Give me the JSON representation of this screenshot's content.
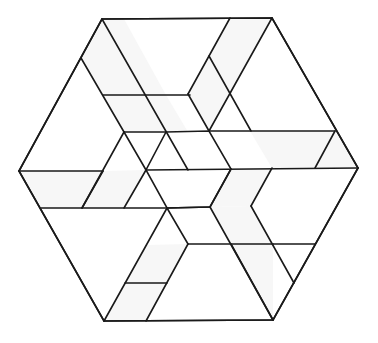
{
  "diagram": {
    "type": "geometric-tiling",
    "stroke_color": "#1a1a1a",
    "shade_color": "#f7f7f7",
    "background": "#ffffff",
    "outer_hexagon": [
      [
        102,
        19
      ],
      [
        272,
        18
      ],
      [
        358,
        168
      ],
      [
        273,
        320
      ],
      [
        104,
        321
      ],
      [
        19,
        171
      ]
    ],
    "center_hexagon": [
      [
        166,
        132
      ],
      [
        209,
        131
      ],
      [
        231,
        169
      ],
      [
        210,
        207
      ],
      [
        167,
        208
      ],
      [
        146,
        170
      ]
    ],
    "shaded_regions": [
      [
        [
          102,
          19
        ],
        [
          124,
          19
        ],
        [
          166,
          95
        ],
        [
          103,
          95
        ],
        [
          81,
          58
        ]
      ],
      [
        [
          103,
          95
        ],
        [
          166,
          95
        ],
        [
          188,
          132
        ],
        [
          124,
          132
        ]
      ],
      [
        [
          230,
          18
        ],
        [
          272,
          18
        ],
        [
          230,
          94
        ],
        [
          209,
          56
        ]
      ],
      [
        [
          209,
          56
        ],
        [
          230,
          94
        ],
        [
          209,
          131
        ],
        [
          188,
          94
        ]
      ],
      [
        [
          250,
          131
        ],
        [
          335,
          131
        ],
        [
          358,
          168
        ],
        [
          272,
          168
        ]
      ],
      [
        [
          231,
          169
        ],
        [
          272,
          168
        ],
        [
          251,
          206
        ],
        [
          210,
          207
        ]
      ],
      [
        [
          210,
          207
        ],
        [
          251,
          206
        ],
        [
          273,
          244
        ],
        [
          231,
          244
        ]
      ],
      [
        [
          231,
          244
        ],
        [
          273,
          244
        ],
        [
          273,
          320
        ],
        [
          252,
          283
        ]
      ],
      [
        [
          104,
          321
        ],
        [
          146,
          321
        ],
        [
          167,
          283
        ],
        [
          125,
          283
        ]
      ],
      [
        [
          125,
          283
        ],
        [
          167,
          283
        ],
        [
          188,
          244
        ],
        [
          146,
          245
        ]
      ],
      [
        [
          19,
          171
        ],
        [
          103,
          171
        ],
        [
          82,
          208
        ],
        [
          41,
          208
        ]
      ],
      [
        [
          103,
          171
        ],
        [
          146,
          170
        ],
        [
          124,
          208
        ],
        [
          82,
          208
        ]
      ]
    ],
    "lines": [
      [
        [
          102,
          19
        ],
        [
          272,
          18
        ]
      ],
      [
        [
          272,
          18
        ],
        [
          358,
          168
        ]
      ],
      [
        [
          358,
          168
        ],
        [
          273,
          320
        ]
      ],
      [
        [
          273,
          320
        ],
        [
          104,
          321
        ]
      ],
      [
        [
          104,
          321
        ],
        [
          19,
          171
        ]
      ],
      [
        [
          19,
          171
        ],
        [
          102,
          19
        ]
      ],
      [
        [
          102,
          19
        ],
        [
          188,
          170
        ]
      ],
      [
        [
          81,
          58
        ],
        [
          124,
          132
        ]
      ],
      [
        [
          103,
          95
        ],
        [
          190,
          95
        ]
      ],
      [
        [
          124,
          132
        ],
        [
          166,
          132
        ]
      ],
      [
        [
          230,
          18
        ],
        [
          188,
          94
        ]
      ],
      [
        [
          272,
          18
        ],
        [
          209,
          131
        ]
      ],
      [
        [
          209,
          56
        ],
        [
          251,
          131
        ]
      ],
      [
        [
          188,
          94
        ],
        [
          209,
          131
        ]
      ],
      [
        [
          209,
          131
        ],
        [
          335,
          131
        ]
      ],
      [
        [
          358,
          168
        ],
        [
          146,
          170
        ]
      ],
      [
        [
          335,
          131
        ],
        [
          315,
          168
        ]
      ],
      [
        [
          272,
          168
        ],
        [
          251,
          206
        ]
      ],
      [
        [
          231,
          169
        ],
        [
          210,
          207
        ]
      ],
      [
        [
          273,
          320
        ],
        [
          210,
          207
        ]
      ],
      [
        [
          315,
          244
        ],
        [
          273,
          244
        ]
      ],
      [
        [
          273,
          244
        ],
        [
          188,
          244
        ]
      ],
      [
        [
          231,
          244
        ],
        [
          273,
          320
        ]
      ],
      [
        [
          251,
          206
        ],
        [
          294,
          283
        ]
      ],
      [
        [
          104,
          321
        ],
        [
          167,
          208
        ]
      ],
      [
        [
          146,
          321
        ],
        [
          188,
          244
        ]
      ],
      [
        [
          125,
          283
        ],
        [
          167,
          283
        ]
      ],
      [
        [
          167,
          208
        ],
        [
          210,
          207
        ]
      ],
      [
        [
          188,
          244
        ],
        [
          167,
          208
        ]
      ],
      [
        [
          19,
          171
        ],
        [
          103,
          171
        ]
      ],
      [
        [
          41,
          208
        ],
        [
          167,
          208
        ]
      ],
      [
        [
          82,
          208
        ],
        [
          103,
          171
        ]
      ],
      [
        [
          124,
          208
        ],
        [
          146,
          170
        ]
      ],
      [
        [
          146,
          170
        ],
        [
          124,
          132
        ]
      ],
      [
        [
          124,
          132
        ],
        [
          82,
          208
        ]
      ]
    ]
  }
}
